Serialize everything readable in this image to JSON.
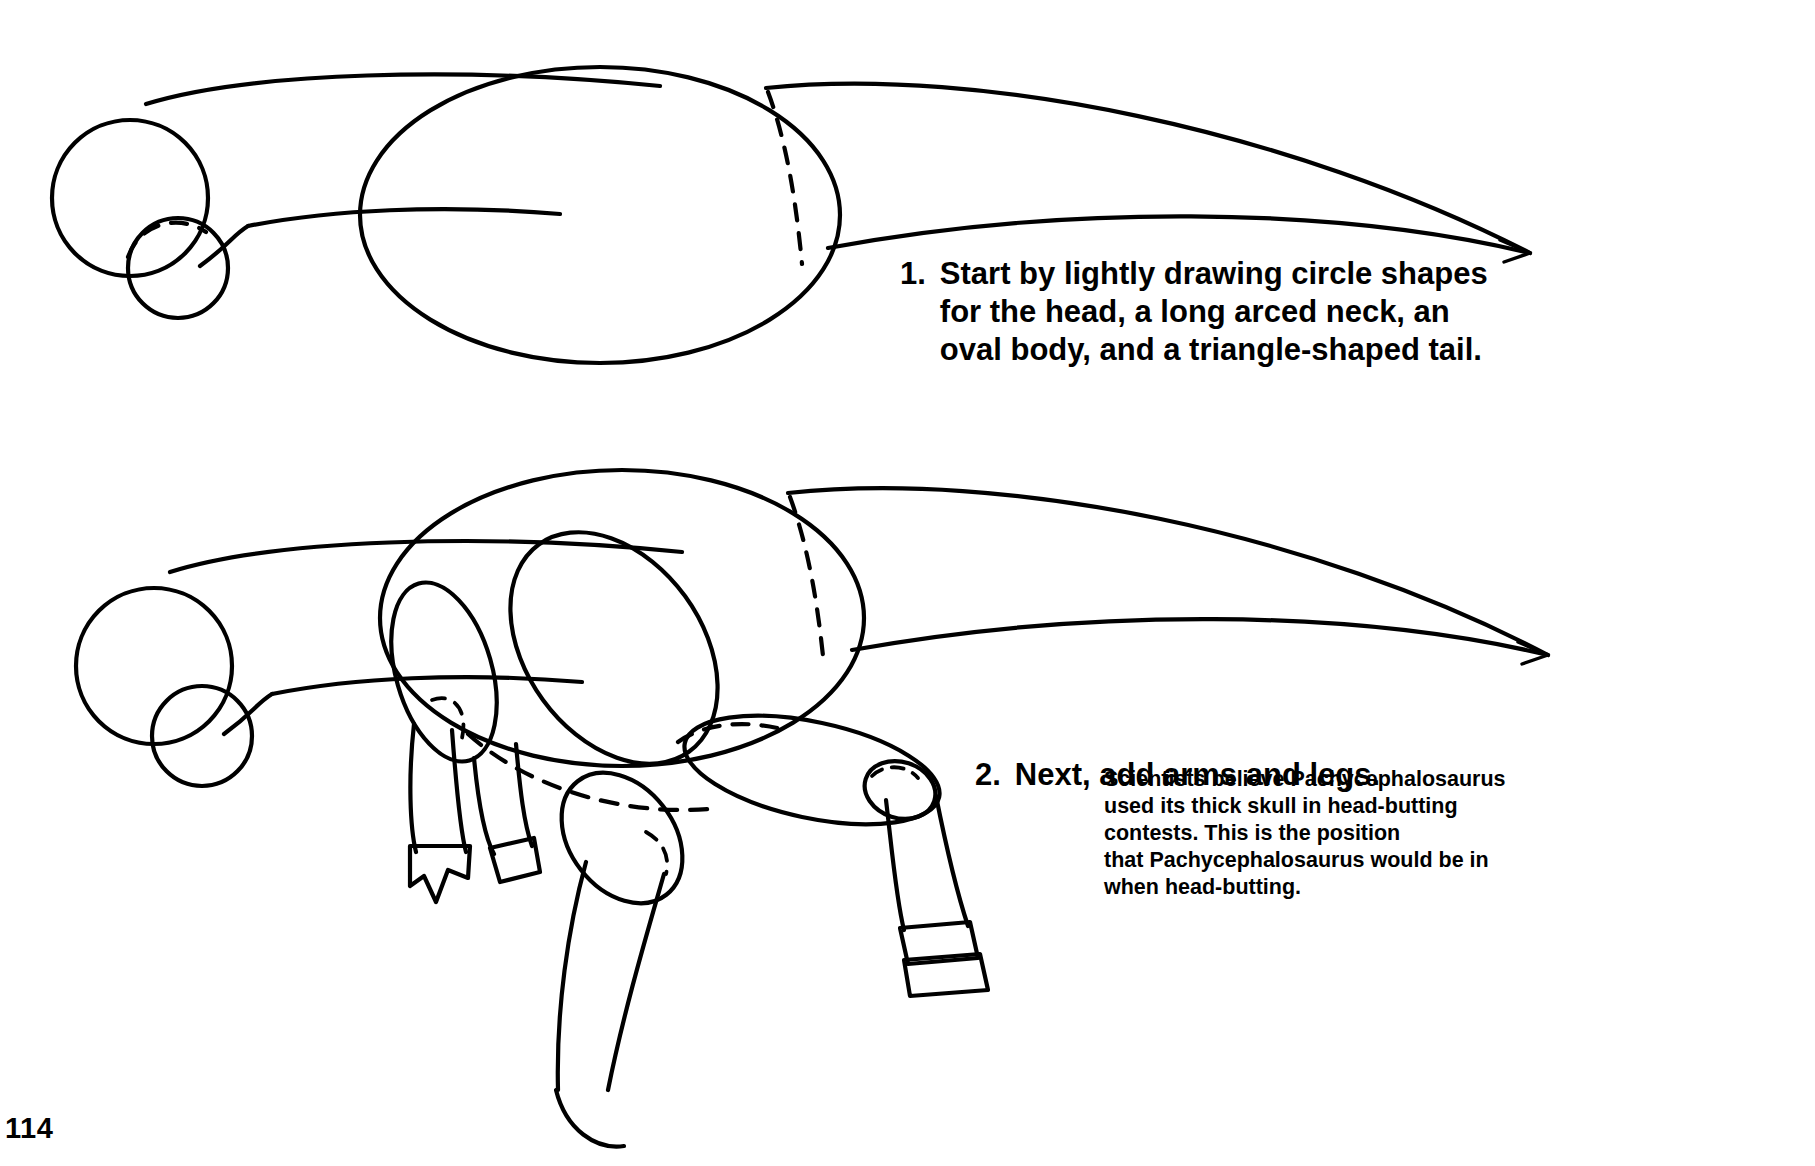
{
  "page": {
    "number": "114",
    "corner_mark": "",
    "background_color": "#ffffff",
    "ink_color": "#000000"
  },
  "steps": [
    {
      "number": "1.",
      "text": "Start by lightly drawing circle shapes\nfor the head, a long arced neck, an\noval body, and a triangle-shaped tail."
    },
    {
      "number": "2.",
      "text": "Next, add arms and legs."
    }
  ],
  "fact_note": {
    "text": "Scientists believe Pachycephalosaurus\nused its thick skull in head-butting\ncontests. This is the position\nthat Pachycephalosaurus would be in\nwhen head-butting."
  },
  "figures": [
    {
      "name": "step-1-figure",
      "caption": "Pachycephalosaurus basic shapes: head circle, snout circle, arced neck, oval body, triangle tail"
    },
    {
      "name": "step-2-figure",
      "caption": "Pachycephalosaurus with arms and legs added as ovals and cylinders"
    }
  ]
}
